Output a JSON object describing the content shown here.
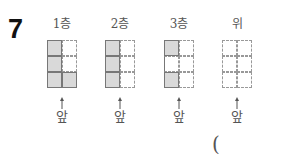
{
  "problem_number": "7",
  "views": [
    {
      "label": "1층",
      "front": "앞",
      "cells": [
        [
          "s",
          "d"
        ],
        [
          "s",
          "d"
        ],
        [
          "s",
          "s"
        ]
      ]
    },
    {
      "label": "2층",
      "front": "앞",
      "cells": [
        [
          "s",
          "d"
        ],
        [
          "s",
          "d"
        ],
        [
          "s",
          "d"
        ]
      ]
    },
    {
      "label": "3층",
      "front": "앞",
      "cells": [
        [
          "s",
          "d"
        ],
        [
          "e",
          "d"
        ],
        [
          "s",
          "d"
        ]
      ]
    },
    {
      "label": "위",
      "front": "앞",
      "cells": [
        [
          "d",
          "d"
        ],
        [
          "d",
          "d"
        ],
        [
          "d",
          "d"
        ]
      ]
    }
  ],
  "answer_paren": "("
}
